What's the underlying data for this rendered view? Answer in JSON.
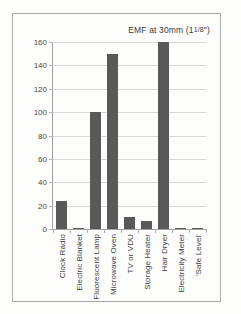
{
  "figure": {
    "background_color": "#fdfdfb",
    "frame_border_color": "#a9a9ab",
    "bar_color": "#595959",
    "grid_color": "#d8d8d6",
    "axis_color": "#a0a0a0",
    "title_inline": "EMF at 30mm (1",
    "title_fraction": "1/8",
    "title_suffix": "\")"
  },
  "chart_data": {
    "type": "bar",
    "xlabel": "",
    "ylabel": "",
    "ylim": [
      0,
      160
    ],
    "yticks": [
      0,
      20,
      40,
      60,
      80,
      100,
      120,
      140,
      160
    ],
    "ytick_labels": [
      "0",
      "20",
      "40",
      "60",
      "80",
      "100",
      "120",
      "140",
      "160"
    ],
    "grid": true,
    "grid_axis": "y",
    "legend": false,
    "legend_position": "none",
    "categories": [
      "Clock Radio",
      "Electric Blanket",
      "Fluorescent Lamp",
      "Microwave Oven",
      "TV or VDU",
      "Storage Heater",
      "Hair Dryer",
      "Electricity Meter",
      "'Safe Level'"
    ],
    "values": [
      24,
      1,
      100,
      150,
      10,
      7,
      160,
      1,
      1
    ],
    "series": [
      {
        "name": "EMF at 30mm",
        "values": [
          24,
          1,
          100,
          150,
          10,
          7,
          160,
          1,
          1
        ]
      }
    ]
  }
}
